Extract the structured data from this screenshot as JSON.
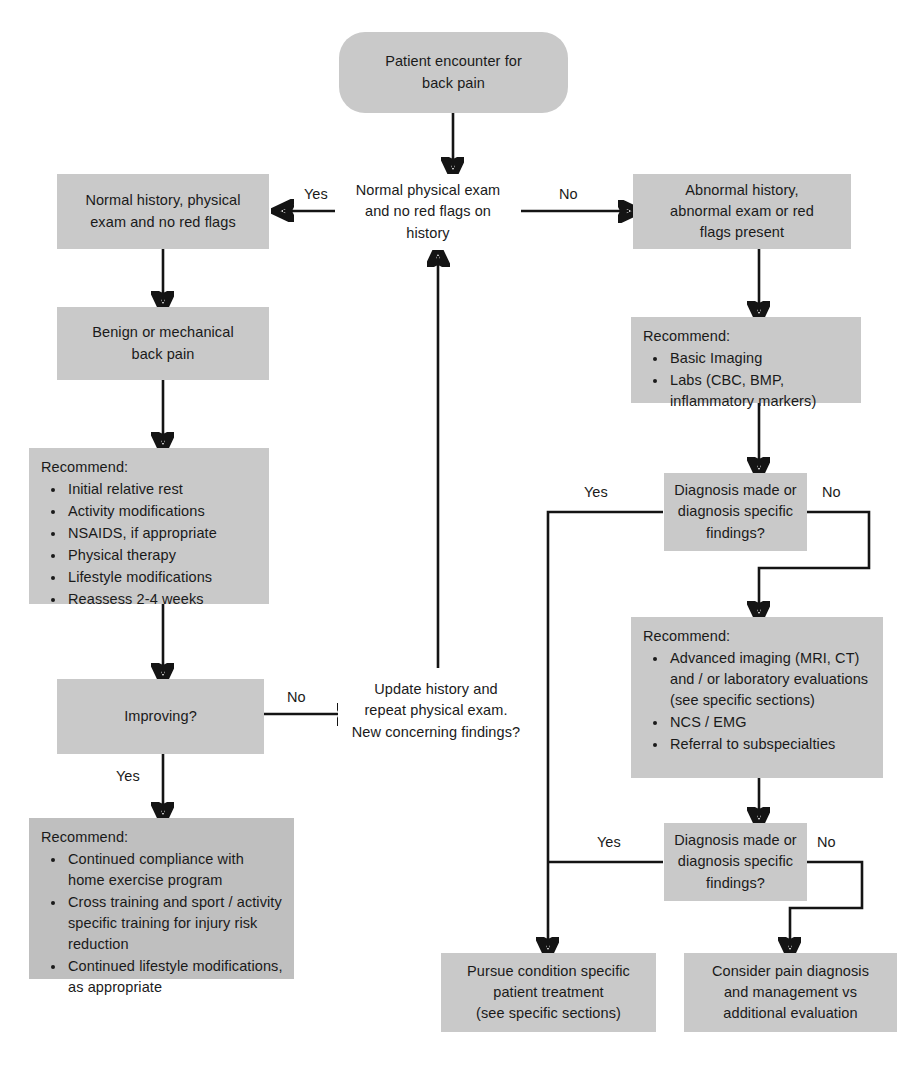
{
  "diagram": {
    "colors": {
      "box_fill": "#c9c9c9",
      "box_fill_dark": "#bfbfbf",
      "box_fill_white": "#ffffff",
      "line": "#141414",
      "text": "#1a1a1a"
    },
    "nodes": {
      "start": {
        "text": "Patient encounter for\nback pain",
        "line1": "Patient encounter for",
        "line2": "back pain"
      },
      "decision_top": {
        "line1": "Normal physical exam",
        "line2": "and no red flags on",
        "line3": "history"
      },
      "normal_left": {
        "line1": "Normal history, physical",
        "line2": "exam and no red flags"
      },
      "abnormal_right": {
        "line1": "Abnormal history,",
        "line2": "abnormal exam or red",
        "line3": "flags present"
      },
      "benign": {
        "line1": "Benign or mechanical",
        "line2": "back pain"
      },
      "recommend_left": {
        "head": "Recommend:",
        "items": [
          "Initial relative rest",
          "Activity modifications",
          "NSAIDS, if appropriate",
          "Physical therapy",
          "Lifestyle modifications",
          "Reassess 2-4 weeks"
        ]
      },
      "recommend_right_basic": {
        "head": "Recommend:",
        "items": [
          "Basic Imaging",
          "Labs (CBC, BMP, inflammatory markers)"
        ]
      },
      "improving": {
        "line1": "Improving?"
      },
      "update_history": {
        "line1": "Update history and",
        "line2": "repeat physical exam.",
        "line3": "New concerning findings?"
      },
      "diagnosis_1": {
        "line1": "Diagnosis made or",
        "line2": "diagnosis specific",
        "line3": "findings?"
      },
      "recommend_right_advanced": {
        "head": "Recommend:",
        "items": [
          "Advanced imaging (MRI, CT) and / or laboratory evaluations (see specific sections)",
          "NCS / EMG",
          "Referral to subspecialties"
        ]
      },
      "diagnosis_2": {
        "line1": "Diagnosis made or",
        "line2": "diagnosis specific",
        "line3": "findings?"
      },
      "recommend_bottom_left": {
        "head": "Recommend:",
        "items": [
          "Continued compliance with home exercise program",
          "Cross training and sport / activity specific training for injury risk reduction",
          "Continued lifestyle modifications, as appropriate"
        ]
      },
      "pursue": {
        "line1": "Pursue condition specific",
        "line2": "patient treatment",
        "line3": "(see specific sections)"
      },
      "consider": {
        "line1": "Consider pain diagnosis",
        "line2": "and management vs",
        "line3": "additional evaluation"
      }
    },
    "edge_labels": {
      "yes_top_left": "Yes",
      "no_top_right": "No",
      "no_improving": "No",
      "yes_improving": "Yes",
      "yes_diagnosis_1": "Yes",
      "no_diagnosis_1": "No",
      "yes_diagnosis_2": "Yes",
      "no_diagnosis_2": "No"
    }
  }
}
